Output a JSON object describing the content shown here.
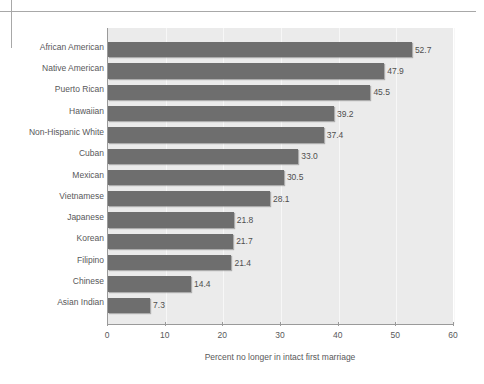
{
  "figure": {
    "background_color": "#ffffff",
    "plot_background_color": "#ebebeb",
    "bar_color": "#6e6e6e",
    "axis_color": "#9a9a9a",
    "text_color": "#58585a"
  },
  "chart_data": {
    "type": "bar",
    "orientation": "horizontal",
    "title": "",
    "subtitle": "",
    "xlabel": "Percent no longer in intact first marriage",
    "ylabel": "",
    "xlim": [
      0,
      60
    ],
    "xticks": [
      0,
      10,
      20,
      30,
      40,
      50,
      60
    ],
    "xtick_labels": [
      "0",
      "10",
      "20",
      "30",
      "40",
      "50",
      "60"
    ],
    "grid": true,
    "grid_axis": "x",
    "legend": false,
    "legend_position": "none",
    "data_labels": true,
    "categories": [
      "African American",
      "Native American",
      "Puerto Rican",
      "Hawaiian",
      "Non-Hispanic White",
      "Cuban",
      "Mexican",
      "Vietnamese",
      "Japanese",
      "Korean",
      "Filipino",
      "Chinese",
      "Asian Indian"
    ],
    "values": [
      52.7,
      47.9,
      45.5,
      39.2,
      37.4,
      33.0,
      30.5,
      28.1,
      21.8,
      21.7,
      21.4,
      14.4,
      7.3
    ],
    "value_labels": [
      "52.7",
      "47.9",
      "45.5",
      "39.2",
      "37.4",
      "33.0",
      "30.5",
      "28.1",
      "21.8",
      "21.7",
      "21.4",
      "14.4",
      "7.3"
    ]
  }
}
